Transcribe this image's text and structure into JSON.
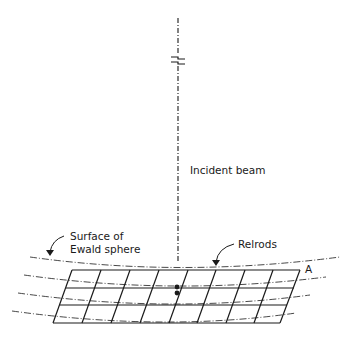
{
  "diagram": {
    "labels": {
      "incident_beam": "Incident beam",
      "ewald_line1": "Surface of",
      "ewald_line2": "Ewald sphere",
      "relrods": "Relrods",
      "point_a": "A"
    },
    "colors": {
      "ink": "#1a1a1a",
      "background": "#ffffff"
    },
    "grid": {
      "rows": 4,
      "columns": 7
    }
  }
}
